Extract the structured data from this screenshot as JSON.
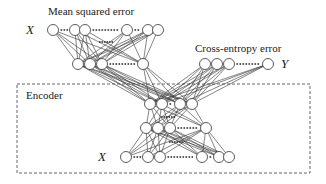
{
  "diagram": {
    "labels": {
      "mse_title": "Mean squared error",
      "ce_title": "Cross-entropy error",
      "encoder": "Encoder",
      "x_top": "X",
      "y_out": "Y",
      "x_bottom": "X"
    },
    "colors": {
      "stroke": "#333333",
      "node_fill": "#ffffff",
      "box_dash": "#555555"
    },
    "layers": {
      "x_top": {
        "y": 30,
        "nodes": [
          53,
          75,
          85,
          127,
          148,
          158
        ]
      },
      "decoder_hidden": {
        "y": 64,
        "nodes": [
          78,
          90,
          102,
          143
        ]
      },
      "y_out": {
        "y": 64,
        "nodes": [
          205,
          217,
          229,
          268
        ]
      },
      "code": {
        "y": 104,
        "nodes": [
          150,
          162,
          180,
          192
        ]
      },
      "encoder_hidden": {
        "y": 128,
        "nodes": [
          146,
          158,
          170,
          206
        ]
      },
      "x_bottom": {
        "y": 157,
        "nodes": [
          126,
          148,
          160,
          202,
          219,
          229
        ]
      }
    }
  }
}
